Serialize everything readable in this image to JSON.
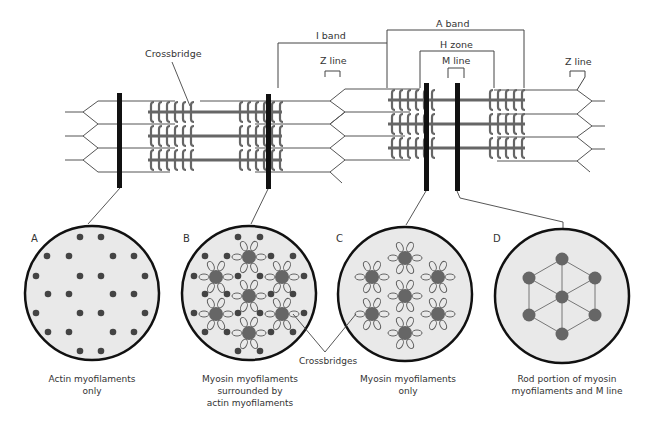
{
  "colors": {
    "line": "#555555",
    "thick_bar": "#111111",
    "myosin": "#666666",
    "circle_fill": "#e8e8e8",
    "circle_border": "#111111",
    "dot": "#444444"
  },
  "labels": {
    "crossbridge": "Crossbridge",
    "i_band": "I band",
    "a_band": "A band",
    "h_zone": "H zone",
    "m_line": "M line",
    "z_line_left": "Z line",
    "z_line_right": "Z line",
    "crossbridges": "Crossbridges"
  },
  "panels": [
    {
      "letter": "A",
      "caption_line1": "Actin myofilaments",
      "caption_line2": "only",
      "caption_line3": ""
    },
    {
      "letter": "B",
      "caption_line1": "Myosin myofilaments",
      "caption_line2": "surrounded by",
      "caption_line3": "actin myofilaments"
    },
    {
      "letter": "C",
      "caption_line1": "Myosin myofilaments",
      "caption_line2": "only",
      "caption_line3": ""
    },
    {
      "letter": "D",
      "caption_line1": "Rod portion of myosin",
      "caption_line2": "myofilaments and M line",
      "caption_line3": ""
    }
  ]
}
